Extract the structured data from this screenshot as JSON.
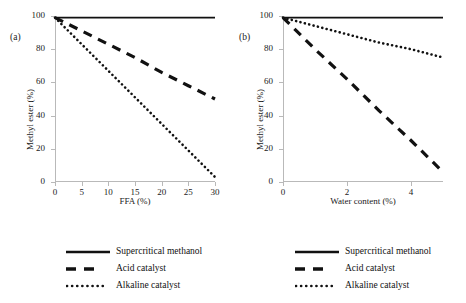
{
  "figure": {
    "panels": [
      {
        "tag": "(a)",
        "ylabel": "Methyl ester (%)",
        "xlabel": "FFA (%)",
        "yticks": [
          0,
          20,
          40,
          60,
          80,
          100
        ],
        "xticks": [
          0,
          5,
          10,
          15,
          20,
          25,
          30
        ],
        "ylim": [
          0,
          100
        ],
        "xlim": [
          0,
          30
        ]
      },
      {
        "tag": "(b)",
        "ylabel": "Methyl ester (%)",
        "xlabel": "Water content (%)",
        "yticks": [
          0,
          20,
          40,
          60,
          80,
          100
        ],
        "xticks": [
          0,
          2,
          4
        ],
        "ylim": [
          0,
          100
        ],
        "xlim": [
          0,
          5
        ]
      }
    ],
    "legend": [
      {
        "label": "Supercritical methanol",
        "style": "solid"
      },
      {
        "label": "Acid catalyst",
        "style": "dashed"
      },
      {
        "label": "Alkaline catalyst",
        "style": "dotted"
      }
    ]
  },
  "chart_data": [
    {
      "type": "line",
      "panel": "(a)",
      "title": "",
      "xlabel": "FFA (%)",
      "ylabel": "Methyl ester (%)",
      "xlim": [
        0,
        30
      ],
      "ylim": [
        0,
        100
      ],
      "xticks": [
        0,
        5,
        10,
        15,
        20,
        25,
        30
      ],
      "yticks": [
        0,
        20,
        40,
        60,
        80,
        100
      ],
      "grid": false,
      "legend_position": "below",
      "x": [
        0,
        5,
        10,
        15,
        20,
        25,
        30
      ],
      "series": [
        {
          "name": "Supercritical methanol",
          "style": "solid",
          "values": [
            99,
            99,
            99,
            99,
            99,
            99,
            99
          ]
        },
        {
          "name": "Acid catalyst",
          "style": "dashed",
          "values": [
            99,
            91,
            83,
            75,
            66,
            58,
            50
          ]
        },
        {
          "name": "Alkaline catalyst",
          "style": "dotted",
          "values": [
            99,
            83,
            67,
            51,
            35,
            19,
            3
          ]
        }
      ]
    },
    {
      "type": "line",
      "panel": "(b)",
      "title": "",
      "xlabel": "Water content (%)",
      "ylabel": "Methyl ester (%)",
      "xlim": [
        0,
        5
      ],
      "ylim": [
        0,
        100
      ],
      "xticks": [
        0,
        2,
        4
      ],
      "yticks": [
        0,
        20,
        40,
        60,
        80,
        100
      ],
      "grid": false,
      "legend_position": "below",
      "x": [
        0,
        1,
        2,
        3,
        4,
        5
      ],
      "series": [
        {
          "name": "Supercritical methanol",
          "style": "solid",
          "values": [
            99,
            99,
            99,
            99,
            99,
            99
          ]
        },
        {
          "name": "Acid catalyst",
          "style": "dashed",
          "values": [
            99,
            80,
            62,
            43,
            25,
            6
          ]
        },
        {
          "name": "Alkaline catalyst",
          "style": "dotted",
          "values": [
            99,
            94,
            89,
            84,
            80,
            75
          ]
        }
      ]
    }
  ]
}
